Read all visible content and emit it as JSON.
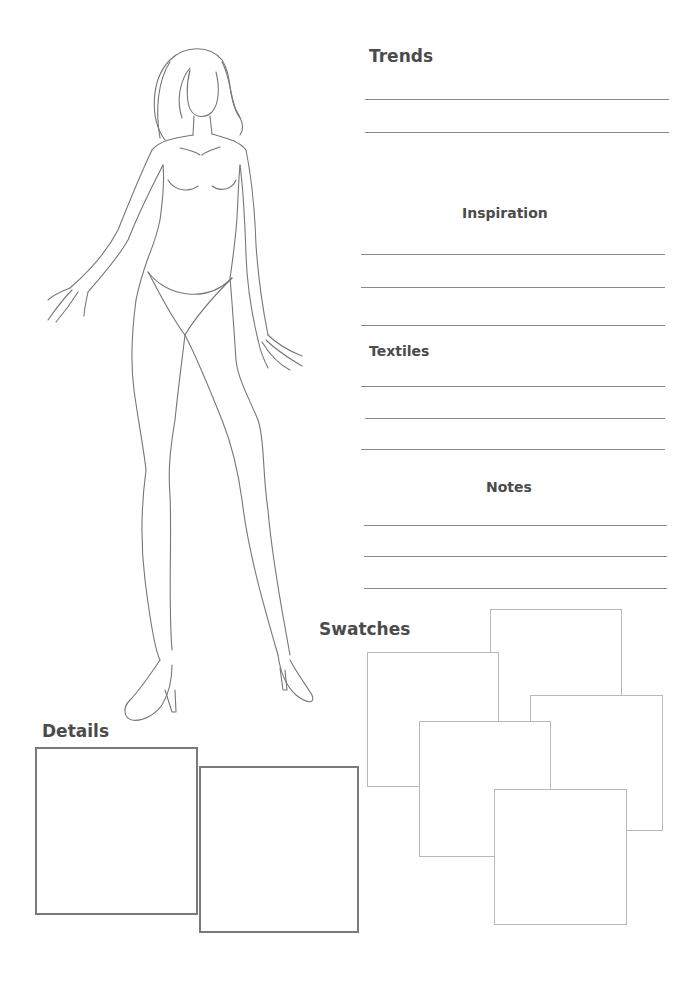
{
  "page": {
    "type": "fashion design croquis worksheet",
    "background": "#ffffff",
    "line_color": "#8a8a8a",
    "text_color": "#4b4b4b"
  },
  "sections": {
    "trends": {
      "title": "Trends",
      "line_count": 2
    },
    "inspiration": {
      "title": "Inspiration",
      "line_count": 3
    },
    "textiles": {
      "title": "Textiles",
      "line_count": 3
    },
    "notes": {
      "title": "Notes",
      "line_count": 3
    },
    "swatches": {
      "title": "Swatches",
      "box_count": 6
    },
    "details": {
      "title": "Details",
      "box_count": 2
    }
  }
}
